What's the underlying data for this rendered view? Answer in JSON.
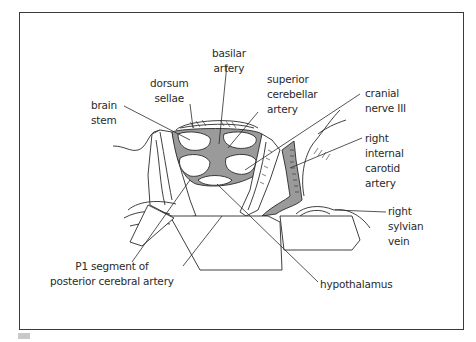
{
  "figure": {
    "type": "anatomical illustration",
    "colors": {
      "frame": "#3a3a3a",
      "vessel_fill": "#9a9a9a",
      "line": "#2a2a2a",
      "background": "#ffffff"
    }
  },
  "labels": {
    "basilar_artery": [
      "basilar",
      "artery"
    ],
    "dorsum_sellae": [
      "dorsum",
      "sellae"
    ],
    "superior_cerebellar_artery": [
      "superior",
      "cerebellar",
      "artery"
    ],
    "brain_stem": [
      "brain",
      "stem"
    ],
    "cranial_nerve_iii": [
      "cranial",
      "nerve III"
    ],
    "right_internal_carotid_artery": [
      "right",
      "internal",
      "carotid",
      "artery"
    ],
    "right_sylvian_vein": [
      "right",
      "sylvian",
      "vein"
    ],
    "p1_segment": [
      "P1 segment of",
      "posterior cerebral artery"
    ],
    "hypothalamus": [
      "hypothalamus"
    ]
  }
}
